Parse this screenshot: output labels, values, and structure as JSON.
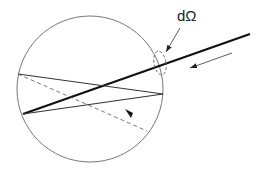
{
  "diagram": {
    "label_solid_angle": "dΩ",
    "elements": {
      "sphere": "circle",
      "incident_ray": "thick line",
      "direction_arrow": "arrow pointing along incident ray",
      "solid_angle_marker": "dashed ellipse",
      "internal_rays": [
        "chord-1",
        "chord-2"
      ],
      "scattered_ray": "dashed line with arrowhead"
    }
  }
}
